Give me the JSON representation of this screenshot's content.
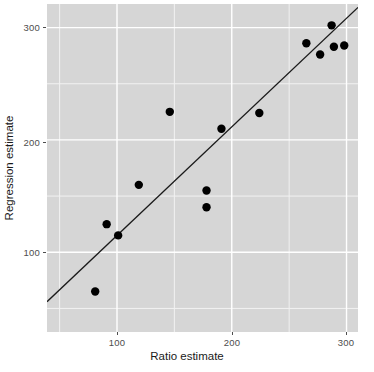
{
  "chart_data": {
    "type": "scatter",
    "title": "",
    "xlabel": "Ratio estimate",
    "ylabel": "Regression estimate",
    "xlim": [
      39,
      310
    ],
    "ylim": [
      29,
      321
    ],
    "xticks": [
      100,
      200,
      300
    ],
    "xtick_labels": [
      "100",
      "200",
      "300"
    ],
    "yticks": [
      100,
      200,
      300
    ],
    "ytick_labels": [
      "100",
      "200",
      "300"
    ],
    "grid": true,
    "grid_major_color": "#ffffff",
    "grid_minor_color": "#f2f2f2",
    "panel_background": "#d6d6d6",
    "legend": null,
    "points": [
      {
        "x": 81,
        "y": 65
      },
      {
        "x": 91,
        "y": 125
      },
      {
        "x": 101,
        "y": 115
      },
      {
        "x": 119,
        "y": 160
      },
      {
        "x": 146,
        "y": 225
      },
      {
        "x": 178,
        "y": 155
      },
      {
        "x": 178,
        "y": 140
      },
      {
        "x": 191,
        "y": 210
      },
      {
        "x": 224,
        "y": 224
      },
      {
        "x": 265,
        "y": 286
      },
      {
        "x": 277,
        "y": 276
      },
      {
        "x": 287,
        "y": 302
      },
      {
        "x": 289,
        "y": 283
      },
      {
        "x": 298,
        "y": 284
      }
    ],
    "point_color": "#000000",
    "point_size": 4.2,
    "line": {
      "name": "fit-line",
      "color": "#1a1a1a",
      "width": 1.3,
      "x0": 39,
      "y0": 56,
      "x1": 310,
      "y1": 318
    }
  }
}
